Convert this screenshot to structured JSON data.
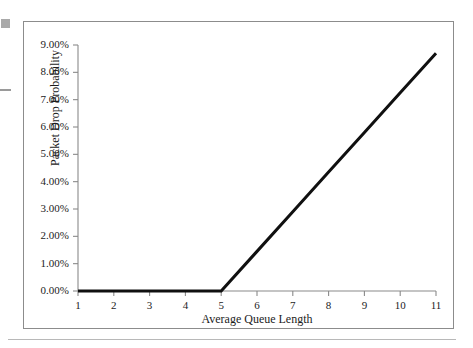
{
  "figure": {
    "frame_color": "#8c8c8c",
    "background_color": "#ffffff",
    "line_color": "#101010",
    "axis_color": "#8a8a8a"
  },
  "artifacts": {
    "square_label": "scan-artifact-square",
    "dash_label": "scan-artifact-dash"
  },
  "chart_data": {
    "type": "line",
    "title": "",
    "subtitle": "",
    "xlabel": "Average Queue Length",
    "ylabel": "Packet Drop Probability",
    "x": [
      1,
      2,
      3,
      4,
      5,
      6,
      7,
      8,
      9,
      10,
      11
    ],
    "series": [
      {
        "name": "Packet Drop Probability",
        "values": [
          0.0,
          0.0,
          0.0,
          0.0,
          0.0,
          1.45,
          2.9,
          4.35,
          5.8,
          7.25,
          8.7
        ],
        "unit": "%",
        "color": "#101010",
        "linewidth": 3
      }
    ],
    "xlim": [
      1,
      11
    ],
    "ylim": [
      0,
      9
    ],
    "xticks": [
      1,
      2,
      3,
      4,
      5,
      6,
      7,
      8,
      9,
      10,
      11
    ],
    "xticklabels": [
      "1",
      "2",
      "3",
      "4",
      "5",
      "6",
      "7",
      "8",
      "9",
      "10",
      "11"
    ],
    "yticks": [
      0,
      1,
      2,
      3,
      4,
      5,
      6,
      7,
      8,
      9
    ],
    "yticklabels": [
      "0.00%",
      "1.00%",
      "2.00%",
      "3.00%",
      "4.00%",
      "5.00%",
      "6.00%",
      "7.00%",
      "8.00%",
      "9.00%"
    ],
    "grid": false,
    "legend": false,
    "legend_position": "none",
    "annotations": []
  }
}
